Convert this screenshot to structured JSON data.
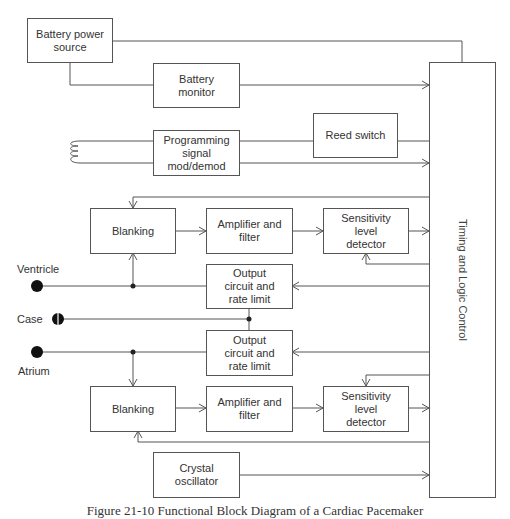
{
  "blocks": {
    "battery_power": "Battery power source",
    "battery_monitor": "Battery monitor",
    "programming": "Programming signal mod/demod",
    "reed_switch": "Reed switch",
    "blanking_top": "Blanking",
    "amplifier_top": "Amplifier and filter",
    "sensitivity_top": "Sensitivity level detector",
    "output_ventricle": "Output circuit and rate limit",
    "output_atrium": "Output circuit and rate limit",
    "blanking_bottom": "Blanking",
    "amplifier_bottom": "Amplifier and filter",
    "sensitivity_bottom": "Sensitivity level detector",
    "crystal": "Crystal oscillator",
    "timing": "Timing and Logic Control"
  },
  "terminals": {
    "ventricle": "Ventricle",
    "case": "Case",
    "atrium": "Atrium"
  },
  "caption": "Figure 21-10 Functional Block Diagram of a Cardiac Pacemaker",
  "colors": {
    "line": "#555555",
    "text": "#333333",
    "terminal": "#111111"
  }
}
